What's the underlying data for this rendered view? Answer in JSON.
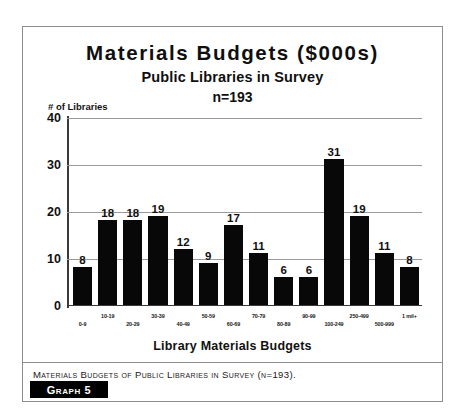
{
  "figure": {
    "title": "Materials Budgets ($000s)",
    "subtitle": "Public Libraries in Survey",
    "sample_note": "n=193",
    "y_axis_title": "# of Libraries",
    "x_axis_title": "Library Materials Budgets",
    "caption": "Materials Budgets of Public Libraries in Survey (n=193).",
    "graph_tag": "Graph 5"
  },
  "chart_data": {
    "type": "bar",
    "title": "Materials Budgets ($000s)",
    "subtitle": "Public Libraries in Survey",
    "annotation": "n=193",
    "xlabel": "Library Materials Budgets",
    "ylabel": "# of Libraries",
    "ylim": [
      0,
      40
    ],
    "yticks": [
      0,
      10,
      20,
      30,
      40
    ],
    "ytick_labels": [
      "0",
      "10",
      "20",
      "30",
      "40"
    ],
    "grid": true,
    "legend": "none",
    "bar_color": "#080808",
    "categories": [
      "0-9",
      "10-19",
      "20-29",
      "30-39",
      "40-49",
      "50-59",
      "60-69",
      "70-79",
      "80-89",
      "90-99",
      "100-249",
      "250-499",
      "500-999",
      "1 mil+"
    ],
    "values": [
      8,
      18,
      18,
      19,
      12,
      9,
      17,
      11,
      6,
      6,
      31,
      19,
      11,
      8
    ],
    "data_labels": [
      "8",
      "18",
      "18",
      "19",
      "12",
      "9",
      "17",
      "11",
      "6",
      "6",
      "31",
      "19",
      "11",
      "8"
    ]
  }
}
